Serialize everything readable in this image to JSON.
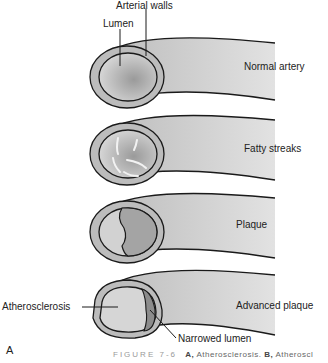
{
  "figure": {
    "panel_label": "A",
    "caption_prefix": "FIGURE 7-6",
    "caption_a_key": "A,",
    "caption_a_text": "Atherosclerosis.",
    "caption_b_key": "B,",
    "caption_b_text": "Atheroscl"
  },
  "stages": [
    {
      "label": "Normal artery"
    },
    {
      "label": "Fatty streaks"
    },
    {
      "label": "Plaque"
    },
    {
      "label": "Advanced plaque"
    }
  ],
  "callouts": {
    "arterial_walls": "Arterial walls",
    "lumen": "Lumen",
    "atherosclerosis": "Atherosclerosis",
    "narrowed_lumen": "Narrowed lumen"
  },
  "colors": {
    "vessel_fill": "#c8c8c8",
    "outline": "#1a1a1a",
    "plaque_fill": "#8c8c8c"
  }
}
